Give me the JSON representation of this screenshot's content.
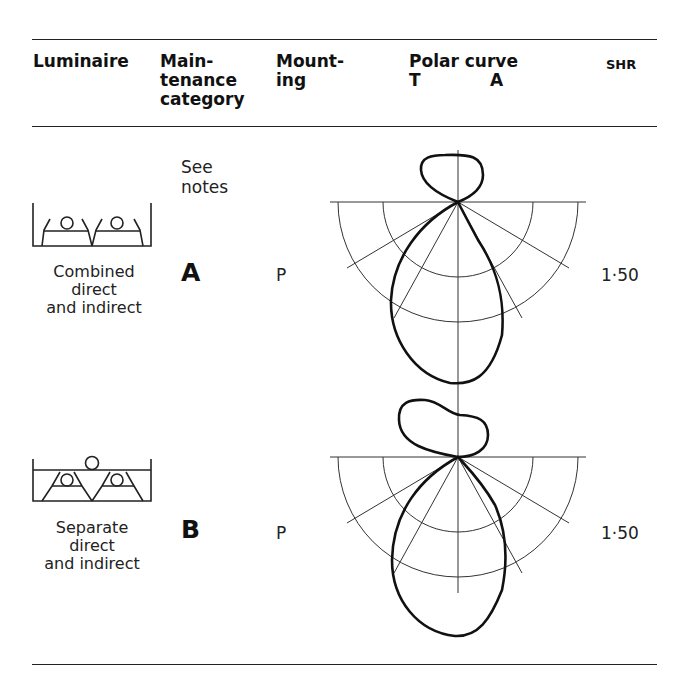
{
  "table": {
    "headers": {
      "luminaire": [
        "Luminaire"
      ],
      "maintenance": [
        "Main-",
        "tenance",
        "category"
      ],
      "mounting": [
        "Mount-",
        "ing"
      ],
      "polar": [
        "Polar curve"
      ],
      "polar_sub": {
        "t": "T",
        "a": "A"
      },
      "shr": [
        "SHR"
      ]
    },
    "rows": [
      {
        "luminaire_caption": [
          "Combined",
          "direct",
          "and indirect"
        ],
        "maintenance_note": [
          "See",
          "notes"
        ],
        "maintenance_category": "A",
        "mounting": "P",
        "shr": "1·50",
        "icon": "combined-direct-indirect-luminaire-icon"
      },
      {
        "luminaire_caption": [
          "Separate",
          "direct",
          "and indirect"
        ],
        "maintenance_category": "B",
        "mounting": "P",
        "shr": "1·50",
        "icon": "separate-direct-indirect-luminaire-icon"
      }
    ]
  },
  "colors": {
    "ink": "#1a1a1a",
    "grid": "#333333",
    "background": "#ffffff"
  }
}
